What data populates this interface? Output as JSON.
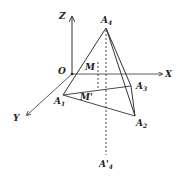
{
  "diagram": {
    "type": "3d-coordinate-tetrahedron",
    "axes": {
      "origin": {
        "label": "O",
        "x": 72,
        "y": 74
      },
      "x_axis": {
        "label": "X",
        "end": [
          162,
          74
        ]
      },
      "y_axis": {
        "label": "Y",
        "end": [
          27,
          115
        ]
      },
      "z_axis": {
        "label": "Z",
        "end": [
          72,
          17
        ]
      }
    },
    "points": {
      "A4": {
        "base": "A",
        "sub": "4",
        "x": 106,
        "y": 28
      },
      "A1": {
        "base": "A",
        "sub": "1",
        "x": 63,
        "y": 95
      },
      "A2": {
        "base": "A",
        "sub": "2",
        "x": 135,
        "y": 116
      },
      "A3": {
        "base": "A",
        "sub": "3",
        "x": 131,
        "y": 86
      },
      "M": {
        "label": "M",
        "x": 98,
        "y": 62
      },
      "M_prime": {
        "label": "M'",
        "x": 98,
        "y": 89
      },
      "A4_prime": {
        "base": "A'",
        "sub": "4",
        "x": 106,
        "y": 155
      }
    },
    "colors": {
      "line": "#333333",
      "label": "#222222",
      "background": "#ffffff"
    }
  }
}
